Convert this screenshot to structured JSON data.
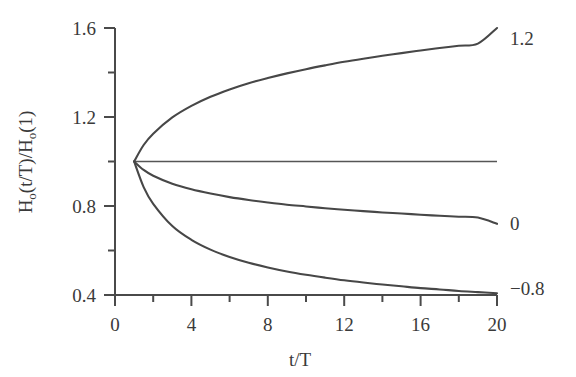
{
  "chart_data": {
    "type": "line",
    "title": "",
    "subtitle": "",
    "xlabel": "t/T",
    "ylabel": "H₀(t/T)/H₀(1)",
    "ylabel_parts": {
      "h": "H",
      "osub": "o",
      "mid": "(t/T)/H",
      "osub2": "o",
      "end": "(1)"
    },
    "xlim": [
      0,
      20
    ],
    "ylim": [
      0.4,
      1.6
    ],
    "xticks": [
      0,
      4,
      8,
      12,
      16,
      20
    ],
    "xtick_labels": [
      "0",
      "4",
      "8",
      "12",
      "16",
      "20"
    ],
    "x_minor_ticks": [
      2,
      6,
      10,
      14,
      18
    ],
    "yticks": [
      0.4,
      0.8,
      1.2,
      1.6
    ],
    "ytick_labels": [
      "0.4",
      "0.8",
      "1.2",
      "1.6"
    ],
    "y_minor_ticks": [
      0.6,
      1.0,
      1.4
    ],
    "grid": false,
    "legend_position": "right-end-labels",
    "converge_point": {
      "x": 1,
      "y": 1.0
    },
    "series": [
      {
        "name": "1.2",
        "end_label": "1.2",
        "x": [
          1,
          1.5,
          2,
          3,
          4,
          5,
          6,
          7,
          8,
          9,
          10,
          11,
          12,
          13,
          14,
          15,
          16,
          17,
          18,
          19,
          20
        ],
        "values": [
          1.0,
          1.074,
          1.125,
          1.198,
          1.25,
          1.291,
          1.324,
          1.352,
          1.375,
          1.396,
          1.415,
          1.432,
          1.448,
          1.462,
          1.475,
          1.487,
          1.499,
          1.51,
          1.52,
          1.53,
          1.6
        ]
      },
      {
        "name": "unlabeled-flat",
        "end_label": "",
        "x": [
          1,
          20
        ],
        "values": [
          1.0,
          1.0
        ]
      },
      {
        "name": "0",
        "end_label": "0",
        "x": [
          1,
          1.5,
          2,
          3,
          4,
          5,
          6,
          7,
          8,
          9,
          10,
          11,
          12,
          13,
          14,
          15,
          16,
          17,
          18,
          19,
          20
        ],
        "values": [
          1.0,
          0.962,
          0.936,
          0.9,
          0.875,
          0.856,
          0.84,
          0.827,
          0.816,
          0.806,
          0.798,
          0.79,
          0.783,
          0.777,
          0.771,
          0.766,
          0.761,
          0.756,
          0.752,
          0.748,
          0.72
        ]
      },
      {
        "name": "−0.8",
        "end_label": "−0.8",
        "x": [
          1,
          1.5,
          2,
          3,
          4,
          5,
          6,
          7,
          8,
          9,
          10,
          11,
          12,
          13,
          14,
          15,
          16,
          17,
          18,
          19,
          20
        ],
        "values": [
          1.0,
          0.885,
          0.81,
          0.71,
          0.648,
          0.604,
          0.571,
          0.545,
          0.524,
          0.506,
          0.491,
          0.478,
          0.466,
          0.456,
          0.447,
          0.439,
          0.431,
          0.425,
          0.418,
          0.413,
          0.408
        ]
      }
    ],
    "colors": {
      "line": "#474747",
      "axis": "#4a4a4a",
      "text": "#3a3a3a",
      "background": "#ffffff"
    }
  }
}
